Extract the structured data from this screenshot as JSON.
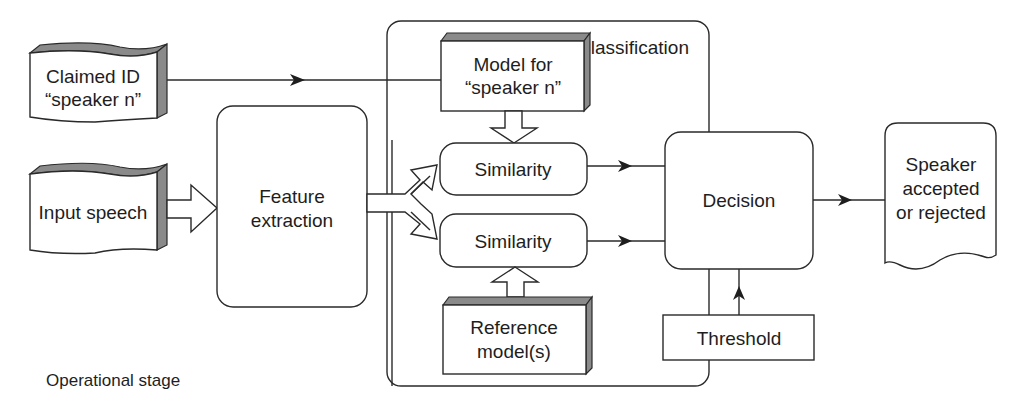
{
  "diagram": {
    "title_stage": "Operational stage",
    "classification_label": "Classification",
    "nodes": {
      "claimed_id": {
        "line1": "Claimed ID",
        "line2": "“speaker n”"
      },
      "input_speech": {
        "line1": "Input speech"
      },
      "feature_extraction": {
        "line1": "Feature",
        "line2": "extraction"
      },
      "model_for_speaker": {
        "line1": "Model for",
        "line2": "“speaker n”"
      },
      "similarity_top": {
        "line1": "Similarity"
      },
      "similarity_bottom": {
        "line1": "Similarity"
      },
      "reference_models": {
        "line1": "Reference",
        "line2": "model(s)"
      },
      "decision": {
        "line1": "Decision"
      },
      "threshold": {
        "line1": "Threshold"
      },
      "output": {
        "line1": "Speaker",
        "line2": "accepted",
        "line3": "or rejected"
      }
    },
    "edges": [
      {
        "from": "claimed_id",
        "to": "model_for_speaker",
        "style": "line-arrow"
      },
      {
        "from": "input_speech",
        "to": "feature_extraction",
        "style": "hollow-arrow"
      },
      {
        "from": "feature_extraction",
        "to": "similarity_top",
        "style": "hollow-fork-arrow"
      },
      {
        "from": "feature_extraction",
        "to": "similarity_bottom",
        "style": "hollow-fork-arrow"
      },
      {
        "from": "model_for_speaker",
        "to": "similarity_top",
        "style": "hollow-arrow"
      },
      {
        "from": "reference_models",
        "to": "similarity_bottom",
        "style": "hollow-arrow"
      },
      {
        "from": "similarity_top",
        "to": "decision",
        "style": "line-arrow"
      },
      {
        "from": "similarity_bottom",
        "to": "decision",
        "style": "line-arrow"
      },
      {
        "from": "threshold",
        "to": "decision",
        "style": "line-arrow"
      },
      {
        "from": "decision",
        "to": "output",
        "style": "line-arrow"
      }
    ],
    "colors": {
      "stroke": "#2a2a2a",
      "shade": "#8a8a8a",
      "background": "#ffffff",
      "text": "#1e1e1e"
    }
  }
}
